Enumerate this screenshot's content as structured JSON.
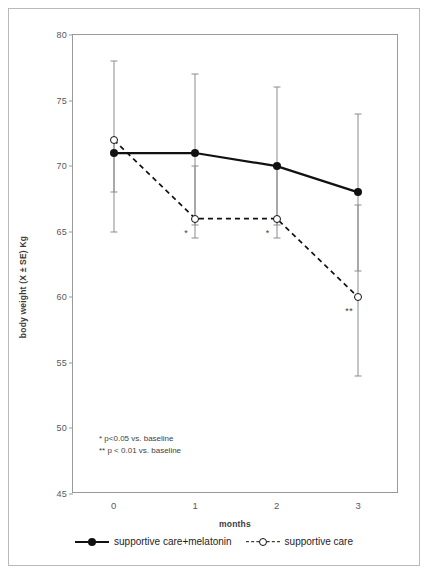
{
  "chart_data": {
    "type": "line",
    "title": "",
    "xlabel": "months",
    "ylabel": "body weight (X ± SE) Kg",
    "x": [
      0,
      1,
      2,
      3
    ],
    "xticklabels": [
      "0",
      "1",
      "2",
      "3"
    ],
    "yticklabels": [
      "45",
      "50",
      "55",
      "60",
      "65",
      "70",
      "75",
      "80"
    ],
    "yticks": [
      45,
      50,
      55,
      60,
      65,
      70,
      75,
      80
    ],
    "ylim": [
      45,
      80
    ],
    "xlim": [
      -0.5,
      3.5
    ],
    "grid": false,
    "legend_position": "bottom",
    "series": [
      {
        "name": "supportive care+melatonin",
        "marker": "filled-circle",
        "line": "solid",
        "values": [
          71,
          71,
          70,
          68
        ],
        "err_low": [
          65,
          65.5,
          65.5,
          62
        ],
        "err_high": [
          78,
          77,
          76,
          74
        ],
        "significance": [
          "",
          "",
          "",
          ""
        ]
      },
      {
        "name": "supportive care",
        "marker": "open-circle",
        "line": "dashed",
        "values": [
          72,
          66,
          66,
          60
        ],
        "err_low": [
          68,
          64.5,
          64.5,
          54
        ],
        "err_high": [
          72,
          70,
          70,
          67
        ],
        "significance": [
          "",
          "*",
          "*",
          "**"
        ]
      }
    ],
    "annotations": [
      "* p<0.05 vs. baseline",
      "** p < 0.01 vs. baseline"
    ]
  },
  "legend": {
    "items": [
      {
        "label": "supportive care+melatonin"
      },
      {
        "label": "supportive care"
      }
    ]
  },
  "colors": {
    "line": "#111111",
    "error_bar": "#8b8b8d",
    "axis": "#9a9a9a",
    "tick_text": "#58585a",
    "frame": "#b9b9b9"
  }
}
